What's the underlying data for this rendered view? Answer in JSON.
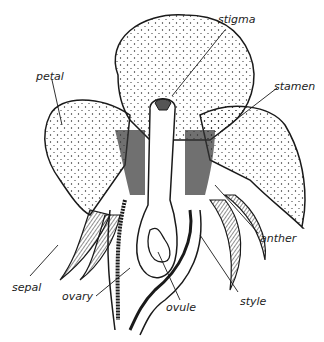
{
  "diagram": {
    "labels": [
      {
        "id": "stigma",
        "text": "stigma",
        "x": 218,
        "y": 20
      },
      {
        "id": "petal",
        "text": "petal",
        "x": 36,
        "y": 71
      },
      {
        "id": "stamen",
        "text": "stamen",
        "x": 274,
        "y": 83
      },
      {
        "id": "anther",
        "text": "anther",
        "x": 260,
        "y": 233
      },
      {
        "id": "sepal",
        "text": "sepal",
        "x": 12,
        "y": 282
      },
      {
        "id": "ovary",
        "text": "ovary",
        "x": 62,
        "y": 292
      },
      {
        "id": "style",
        "text": "style",
        "x": 240,
        "y": 297
      },
      {
        "id": "ovule",
        "text": "ovule",
        "x": 166,
        "y": 303
      }
    ],
    "colors": {
      "ink": "#1a1a1a",
      "background": "#ffffff"
    }
  }
}
